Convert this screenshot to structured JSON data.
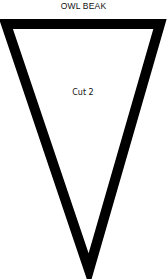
{
  "title": "OWL BEAK",
  "piece": {
    "label": "Cut 2",
    "shape": "inverted-triangle",
    "stroke_color": "#000000",
    "fill_color": "#ffffff"
  }
}
